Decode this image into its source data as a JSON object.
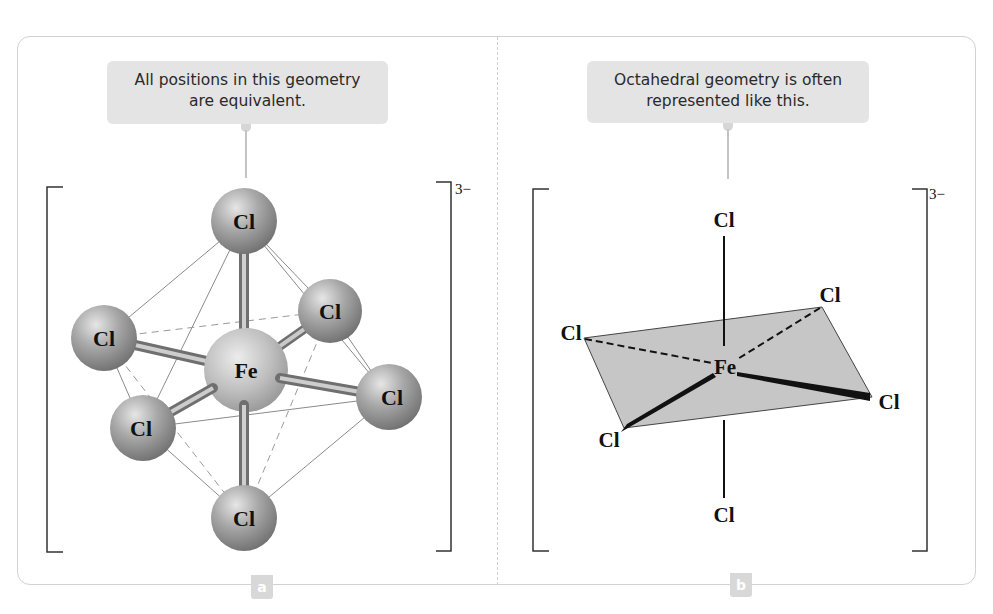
{
  "figure": {
    "panels": [
      {
        "id": "a",
        "tag": "a",
        "callout": {
          "lines": [
            "All positions in this geometry",
            "are equivalent."
          ]
        },
        "charge": "3−",
        "model": "ball-and-stick",
        "central_atom": "Fe",
        "ligands": [
          "Cl",
          "Cl",
          "Cl",
          "Cl",
          "Cl",
          "Cl"
        ]
      },
      {
        "id": "b",
        "tag": "b",
        "callout": {
          "lines": [
            "Octahedral geometry is often",
            "represented like this."
          ]
        },
        "charge": "3−",
        "model": "wedge-dash",
        "central_atom": "Fe",
        "ligands": [
          "Cl",
          "Cl",
          "Cl",
          "Cl",
          "Cl",
          "Cl"
        ]
      }
    ],
    "colors": {
      "frame_border": "#d2d2d2",
      "callout_bg": "#e4e4e4",
      "tag_bg": "#d8d8d8",
      "plane_fill": "#c4c4c4",
      "atom_gray": "#9a9a9a"
    }
  }
}
